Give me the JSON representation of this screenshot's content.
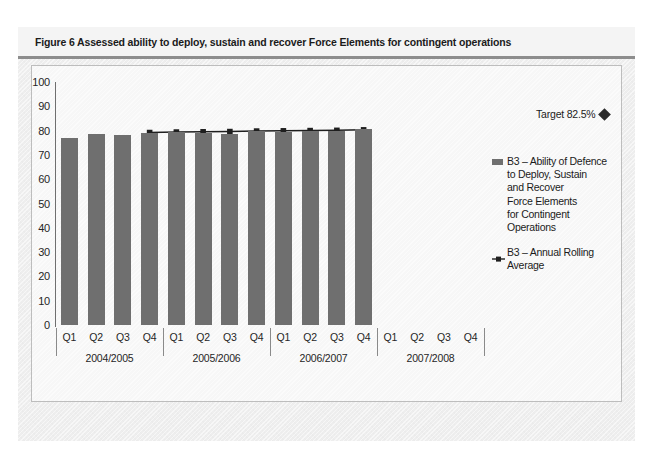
{
  "figure": {
    "caption": "Figure 6 Assessed ability to deploy, sustain and recover Force Elements for contingent operations"
  },
  "colors": {
    "bar": "#6f6f6f",
    "line": "#1f1f1f",
    "panel_background": "#eeeeee",
    "plot_background": "#f7f7f7",
    "axis": "#6f6f6f",
    "text": "#1b1b1b"
  },
  "legend": {
    "position": "right",
    "items": [
      {
        "marker": "bar-swatch",
        "label": "B3 – Ability of Defence\nto Deploy, Sustain\nand Recover\nForce Elements\nfor Contingent\nOperations"
      },
      {
        "marker": "line-square-marker",
        "label": "B3 – Annual Rolling\nAverage"
      }
    ]
  },
  "annotation": {
    "target_label": "Target 82.5%",
    "target_value": 82.5,
    "marker": "diamond"
  },
  "axis": {
    "y_ticks": [
      100,
      90,
      80,
      70,
      60,
      50,
      40,
      30,
      20,
      10,
      0
    ],
    "y_min": 0,
    "y_max": 100,
    "quarter_labels": [
      "Q1",
      "Q2",
      "Q3",
      "Q4",
      "Q1",
      "Q2",
      "Q3",
      "Q4",
      "Q1",
      "Q2",
      "Q3",
      "Q4",
      "Q1",
      "Q2",
      "Q3",
      "Q4"
    ],
    "year_groups": [
      "2004/2005",
      "2005/2006",
      "2006/2007",
      "2007/2008"
    ]
  },
  "chart_data": {
    "type": "bar",
    "title": "Figure 6 Assessed ability to deploy, sustain and recover Force Elements for contingent operations",
    "xlabel": "",
    "ylabel": "",
    "ylim": [
      0,
      100
    ],
    "grid": false,
    "legend_position": "right",
    "categories": [
      "Q1 2004/2005",
      "Q2 2004/2005",
      "Q3 2004/2005",
      "Q4 2004/2005",
      "Q1 2005/2006",
      "Q2 2005/2006",
      "Q3 2005/2006",
      "Q4 2005/2006",
      "Q1 2006/2007",
      "Q2 2006/2007",
      "Q3 2006/2007",
      "Q4 2006/2007",
      "Q1 2007/2008",
      "Q2 2007/2008",
      "Q3 2007/2008",
      "Q4 2007/2008"
    ],
    "series": [
      {
        "name": "B3 – Ability of Defence to Deploy, Sustain and Recover Force Elements for Contingent Operations",
        "type": "bar",
        "values": [
          77.0,
          78.5,
          78.0,
          79.0,
          79.5,
          79.0,
          78.5,
          80.0,
          79.5,
          80.0,
          80.0,
          80.5,
          null,
          null,
          null,
          null
        ]
      },
      {
        "name": "B3 – Annual Rolling Average",
        "type": "line",
        "values": [
          null,
          null,
          null,
          79.2,
          79.4,
          79.5,
          79.6,
          79.8,
          79.9,
          80.0,
          80.1,
          80.3,
          null,
          null,
          null,
          null
        ]
      }
    ],
    "target_line": {
      "label": "Target 82.5%",
      "value": 82.5,
      "marker": "diamond"
    }
  }
}
